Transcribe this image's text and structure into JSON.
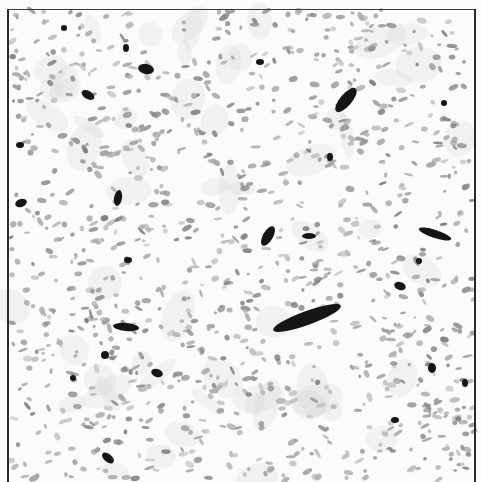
{
  "image": {
    "description": "Grayscale histology micrograph of spindle-cell tissue with scattered gray nuclei and dark elongated vessels",
    "background": "#fbfbfb",
    "nucleus_color": "#9a9a9a",
    "vessel_color": "#151515",
    "frame_color": "#2a2a2a"
  },
  "vessels": [
    {
      "cx": 307,
      "cy": 318,
      "rx": 36,
      "ry": 7,
      "rot": -20
    },
    {
      "cx": 346,
      "cy": 100,
      "rx": 15,
      "ry": 6,
      "rot": -50
    },
    {
      "cx": 268,
      "cy": 236,
      "rx": 11,
      "ry": 5,
      "rot": -60
    },
    {
      "cx": 435,
      "cy": 234,
      "rx": 17,
      "ry": 4,
      "rot": 18
    },
    {
      "cx": 146,
      "cy": 69,
      "rx": 8,
      "ry": 5,
      "rot": 10
    },
    {
      "cx": 88,
      "cy": 95,
      "rx": 7,
      "ry": 4,
      "rot": 30
    },
    {
      "cx": 126,
      "cy": 327,
      "rx": 13,
      "ry": 4,
      "rot": 5
    },
    {
      "cx": 118,
      "cy": 198,
      "rx": 4,
      "ry": 8,
      "rot": 10
    },
    {
      "cx": 21,
      "cy": 203,
      "rx": 6,
      "ry": 4,
      "rot": -20
    },
    {
      "cx": 108,
      "cy": 458,
      "rx": 7,
      "ry": 4,
      "rot": 40
    },
    {
      "cx": 157,
      "cy": 373,
      "rx": 6,
      "ry": 4,
      "rot": 20
    },
    {
      "cx": 400,
      "cy": 286,
      "rx": 6,
      "ry": 4,
      "rot": 20
    },
    {
      "cx": 309,
      "cy": 236,
      "rx": 7,
      "ry": 3,
      "rot": 0
    },
    {
      "cx": 330,
      "cy": 157,
      "rx": 3,
      "ry": 4,
      "rot": 0
    },
    {
      "cx": 260,
      "cy": 62,
      "rx": 4,
      "ry": 3,
      "rot": 0
    },
    {
      "cx": 126,
      "cy": 48,
      "rx": 3,
      "ry": 4,
      "rot": 0
    },
    {
      "cx": 105,
      "cy": 355,
      "rx": 4,
      "ry": 4,
      "rot": 0
    },
    {
      "cx": 73,
      "cy": 378,
      "rx": 3,
      "ry": 3,
      "rot": 0
    },
    {
      "cx": 432,
      "cy": 368,
      "rx": 4,
      "ry": 5,
      "rot": 0
    },
    {
      "cx": 465,
      "cy": 383,
      "rx": 3,
      "ry": 4,
      "rot": 0
    },
    {
      "cx": 395,
      "cy": 420,
      "rx": 4,
      "ry": 3,
      "rot": 0
    },
    {
      "cx": 444,
      "cy": 103,
      "rx": 3,
      "ry": 3,
      "rot": 0
    },
    {
      "cx": 419,
      "cy": 261,
      "rx": 3,
      "ry": 3,
      "rot": 0
    },
    {
      "cx": 20,
      "cy": 145,
      "rx": 4,
      "ry": 3,
      "rot": 0
    },
    {
      "cx": 128,
      "cy": 260,
      "rx": 4,
      "ry": 3,
      "rot": 0
    },
    {
      "cx": 64,
      "cy": 28,
      "rx": 3,
      "ry": 3,
      "rot": 0
    }
  ],
  "nuclei_seed": 20240517,
  "nuclei_count": 1100
}
